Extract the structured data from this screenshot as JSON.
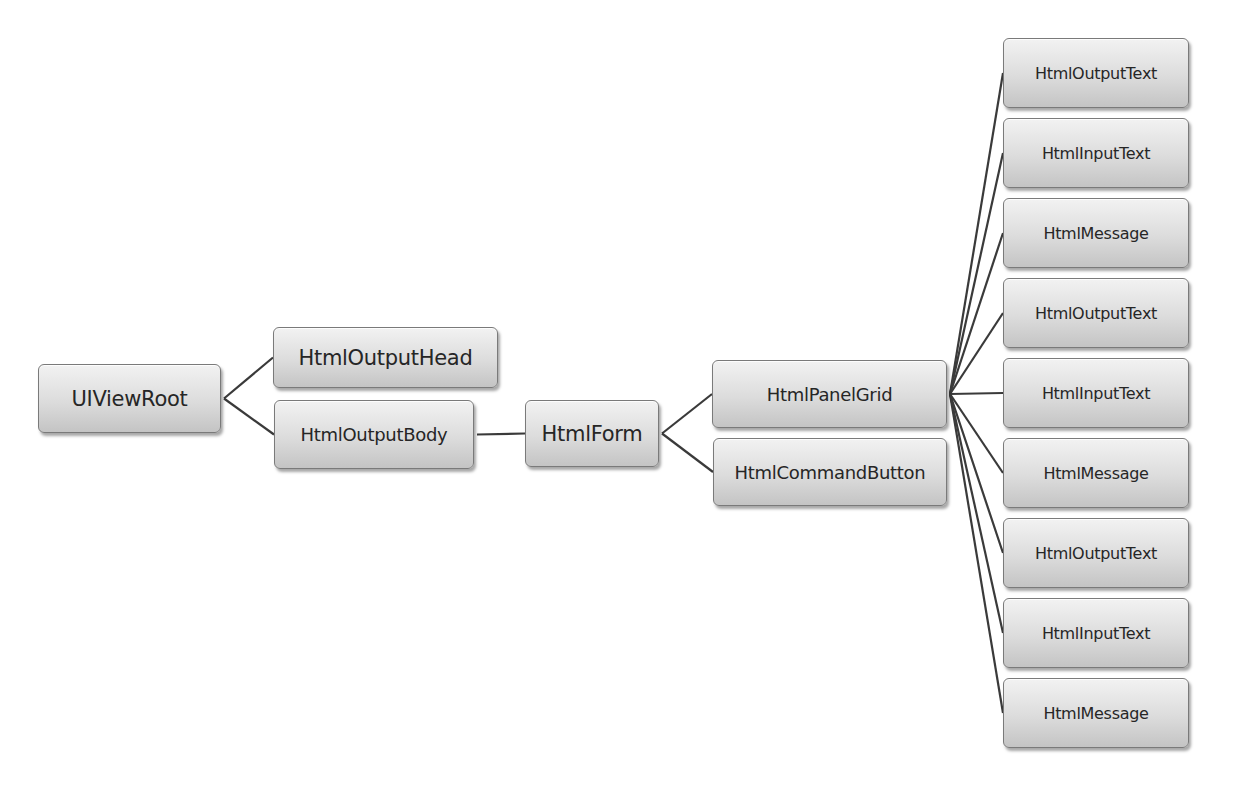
{
  "diagram": {
    "background": "#ffffff",
    "node_fill_top": "#f2f2f2",
    "node_fill_bottom": "#c4c4c4",
    "node_border": "#7a7a7a",
    "line_color": "#3a3a3a",
    "nodes": {
      "root": {
        "label": "UIViewRoot",
        "x": 38,
        "y": 364,
        "w": 183,
        "h": 69
      },
      "output_head": {
        "label": "HtmlOutputHead",
        "x": 273,
        "y": 327,
        "w": 225,
        "h": 61
      },
      "output_body": {
        "label": "HtmlOutputBody",
        "x": 274,
        "y": 400,
        "w": 200,
        "h": 69
      },
      "form": {
        "label": "HtmlForm",
        "x": 525,
        "y": 400,
        "w": 134,
        "h": 67
      },
      "panel_grid": {
        "label": "HtmlPanelGrid",
        "x": 712,
        "y": 360,
        "w": 235,
        "h": 68
      },
      "command_button": {
        "label": "HtmlCommandButton",
        "x": 713,
        "y": 438,
        "w": 234,
        "h": 68
      }
    },
    "grid_children": [
      {
        "label": "HtmlOutputText",
        "x": 1003,
        "y": 38,
        "w": 186,
        "h": 70
      },
      {
        "label": "HtmlInputText",
        "x": 1003,
        "y": 118,
        "w": 186,
        "h": 70
      },
      {
        "label": "HtmlMessage",
        "x": 1003,
        "y": 198,
        "w": 186,
        "h": 70
      },
      {
        "label": "HtmlOutputText",
        "x": 1003,
        "y": 278,
        "w": 186,
        "h": 70
      },
      {
        "label": "HtmlInputText",
        "x": 1003,
        "y": 358,
        "w": 186,
        "h": 70
      },
      {
        "label": "HtmlMessage",
        "x": 1003,
        "y": 438,
        "w": 186,
        "h": 70
      },
      {
        "label": "HtmlOutputText",
        "x": 1003,
        "y": 518,
        "w": 186,
        "h": 70
      },
      {
        "label": "HtmlInputText",
        "x": 1003,
        "y": 598,
        "w": 186,
        "h": 70
      },
      {
        "label": "HtmlMessage",
        "x": 1003,
        "y": 678,
        "w": 186,
        "h": 70
      }
    ],
    "edges": [
      [
        "root",
        "output_head"
      ],
      [
        "root",
        "output_body"
      ],
      [
        "output_body",
        "form"
      ],
      [
        "form",
        "panel_grid"
      ],
      [
        "form",
        "command_button"
      ],
      [
        "panel_grid",
        "grid_child_0"
      ],
      [
        "panel_grid",
        "grid_child_1"
      ],
      [
        "panel_grid",
        "grid_child_2"
      ],
      [
        "panel_grid",
        "grid_child_3"
      ],
      [
        "panel_grid",
        "grid_child_4"
      ],
      [
        "panel_grid",
        "grid_child_5"
      ],
      [
        "panel_grid",
        "grid_child_6"
      ],
      [
        "panel_grid",
        "grid_child_7"
      ],
      [
        "panel_grid",
        "grid_child_8"
      ]
    ]
  }
}
